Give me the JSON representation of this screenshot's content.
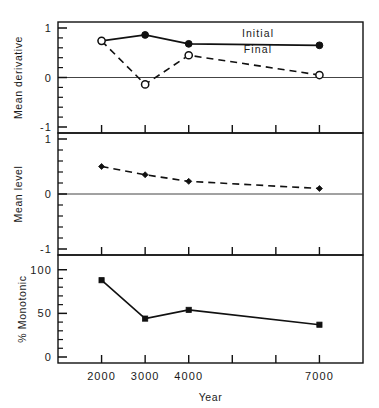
{
  "figure": {
    "xlabel": "Year",
    "x_tick_labels": [
      "2000",
      "3000",
      "4000",
      "7000"
    ]
  },
  "chart_data": [
    {
      "type": "line",
      "panel": "top",
      "title": "",
      "xlabel": "Year",
      "ylabel": "Mean derivative",
      "xlim": [
        1000,
        8000
      ],
      "ylim": [
        -1,
        1
      ],
      "yticks": [
        -1,
        0,
        1
      ],
      "ytick_labels": [
        "-1",
        "0",
        "1"
      ],
      "y_minor_ticks": [
        -0.8,
        -0.6,
        -0.4,
        -0.2,
        0.2,
        0.4,
        0.6,
        0.8
      ],
      "grid": false,
      "zero_line": true,
      "x": [
        2000,
        3000,
        4000,
        7000
      ],
      "legend_position": "inline-right",
      "series": [
        {
          "name": "Initial",
          "values": [
            0.74,
            0.86,
            0.68,
            0.65
          ],
          "style": "solid",
          "marker": "filled-circle"
        },
        {
          "name": "Final",
          "values": [
            0.74,
            -0.14,
            0.45,
            0.05
          ],
          "style": "dashed",
          "marker": "open-circle"
        }
      ]
    },
    {
      "type": "line",
      "panel": "middle",
      "title": "",
      "xlabel": "Year",
      "ylabel": "Mean level",
      "xlim": [
        1000,
        8000
      ],
      "ylim": [
        -1,
        1
      ],
      "yticks": [
        -1,
        0,
        1
      ],
      "ytick_labels": [
        "-1",
        "0",
        "1"
      ],
      "y_minor_ticks": [
        -0.8,
        -0.6,
        -0.4,
        -0.2,
        0.2,
        0.4,
        0.6,
        0.8
      ],
      "grid": false,
      "zero_line": true,
      "x": [
        2000,
        3000,
        4000,
        7000
      ],
      "series": [
        {
          "name": "Mean level",
          "values": [
            0.5,
            0.35,
            0.23,
            0.1
          ],
          "style": "dashed",
          "marker": "filled-diamond"
        }
      ]
    },
    {
      "type": "line",
      "panel": "bottom",
      "title": "",
      "xlabel": "Year",
      "ylabel": "% Monotonic",
      "xlim": [
        1000,
        8000
      ],
      "ylim": [
        0,
        110
      ],
      "yticks": [
        0,
        50,
        100
      ],
      "ytick_labels": [
        "0",
        "50",
        "100"
      ],
      "y_minor_ticks": [
        10,
        20,
        30,
        40,
        60,
        70,
        80,
        90
      ],
      "grid": false,
      "zero_line": false,
      "x": [
        2000,
        3000,
        4000,
        7000
      ],
      "series": [
        {
          "name": "% Monotonic",
          "values": [
            88,
            44,
            54,
            37
          ],
          "style": "solid",
          "marker": "filled-square"
        }
      ]
    }
  ]
}
